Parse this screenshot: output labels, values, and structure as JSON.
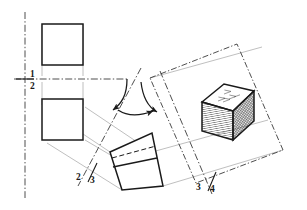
{
  "drawing": {
    "title": "Orthographic-to-isometric rotation construction",
    "background_color": "#ffffff",
    "line_color": "#1a1a1a",
    "thin_line_color": "#777777",
    "hatch_color": "#333333"
  },
  "labels": {
    "axis_1": "1",
    "axis_2": "2",
    "axis_2b": "2",
    "axis_3": "3",
    "axis_3b": "3",
    "axis_4": "4"
  },
  "views": {
    "top_square": {
      "name": "upper front view square"
    },
    "lower_square": {
      "name": "lower front view square"
    },
    "rotated_rect": {
      "name": "rotated divided rectangle"
    },
    "iso_cube": {
      "name": "isometric hatched cube",
      "faces": [
        "top",
        "left",
        "right"
      ],
      "top_face_fill": "#ffffff",
      "left_face_pattern": "vertical-hatch",
      "right_face_pattern": "cross-hatch"
    },
    "tilted_frame": {
      "name": "tilted dash-dot picture frame"
    }
  },
  "annotations": {
    "arc_left": {
      "name": "left rotation angle arc"
    },
    "arc_right": {
      "name": "right rotation angle arc"
    }
  }
}
